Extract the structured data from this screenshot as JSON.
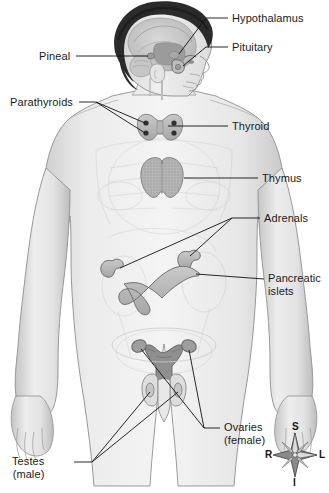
{
  "figure": {
    "background_color": "#ffffff",
    "body_fill": "#e9e9e9",
    "organ_fill": "#b9b9b9",
    "hair_fill": "#2b2b2b",
    "leader_color": "#111111",
    "label_color": "#1a1a1a"
  },
  "labels": [
    {
      "id": "hypothalamus",
      "text": "Hypothalamus",
      "side": "right",
      "x": 232,
      "y": 12
    },
    {
      "id": "pituitary",
      "text": "Pituitary",
      "side": "right",
      "x": 232,
      "y": 41
    },
    {
      "id": "pineal",
      "text": "Pineal",
      "side": "left",
      "x": 39,
      "y": 50
    },
    {
      "id": "parathyroids",
      "text": "Parathyroids",
      "side": "left",
      "x": 10,
      "y": 96
    },
    {
      "id": "thyroid",
      "text": "Thyroid",
      "side": "right",
      "x": 232,
      "y": 120
    },
    {
      "id": "thymus",
      "text": "Thymus",
      "side": "right",
      "x": 262,
      "y": 172
    },
    {
      "id": "adrenals",
      "text": "Adrenals",
      "side": "right",
      "x": 264,
      "y": 212
    },
    {
      "id": "pancreatic-islets",
      "text": "Pancreatic\nislets",
      "side": "right",
      "x": 268,
      "y": 272
    },
    {
      "id": "ovaries",
      "text": "Ovaries\n(female)",
      "side": "right",
      "x": 224,
      "y": 421
    },
    {
      "id": "testes",
      "text": "Testes\n(male)",
      "side": "left",
      "x": 12,
      "y": 455
    }
  ],
  "organs": [
    {
      "id": "pineal-gland",
      "name": "pineal gland"
    },
    {
      "id": "pituitary-gland",
      "name": "pituitary gland"
    },
    {
      "id": "hypothalamus-region",
      "name": "hypothalamus"
    },
    {
      "id": "thyroid-gland",
      "name": "thyroid gland"
    },
    {
      "id": "parathyroid-glands",
      "name": "parathyroid glands",
      "count": 4
    },
    {
      "id": "thymus-gland",
      "name": "thymus"
    },
    {
      "id": "adrenal-glands",
      "name": "adrenal glands",
      "count": 2
    },
    {
      "id": "pancreas",
      "name": "pancreas with islets"
    },
    {
      "id": "ovaries-organ",
      "name": "ovaries"
    },
    {
      "id": "uterus",
      "name": "uterus"
    },
    {
      "id": "testes-organ",
      "name": "testes"
    }
  ],
  "compass": {
    "name": "anatomical-orientation-compass",
    "superior": "S",
    "inferior": "I",
    "right": "R",
    "left": "L"
  }
}
